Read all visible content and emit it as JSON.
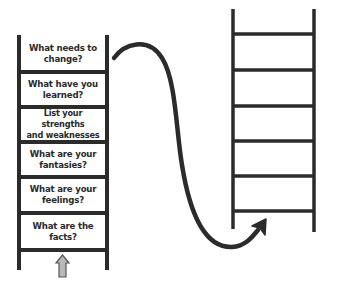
{
  "diagram": {
    "type": "two-ladders-with-transition-arrow",
    "colors": {
      "line": "#2b2b2b",
      "up_arrow_fill": "#b8b8b8",
      "background": "#ffffff"
    },
    "left_ladder": {
      "steps_bottom_to_top": [
        "What are the\nfacts?",
        "What are your\nfeelings?",
        "What are your\nfantasies?",
        "List your strengths\nand weaknesses",
        "What have you\nlearned?",
        "What needs to\nchange?"
      ],
      "steps": [
        {
          "label": "What needs to\nchange?"
        },
        {
          "label": "What have you\nlearned?"
        },
        {
          "label": "List your strengths\nand weaknesses"
        },
        {
          "label": "What are your\nfantasies?"
        },
        {
          "label": "What are your\nfeelings?"
        },
        {
          "label": "What are the\nfacts?"
        }
      ],
      "start_icon": "up-arrow-icon"
    },
    "connector": {
      "icon": "curved-arrow-icon",
      "from": "left-ladder-top",
      "to": "right-ladder-bottom"
    },
    "right_ladder": {
      "rungs": 6,
      "labels": []
    }
  }
}
